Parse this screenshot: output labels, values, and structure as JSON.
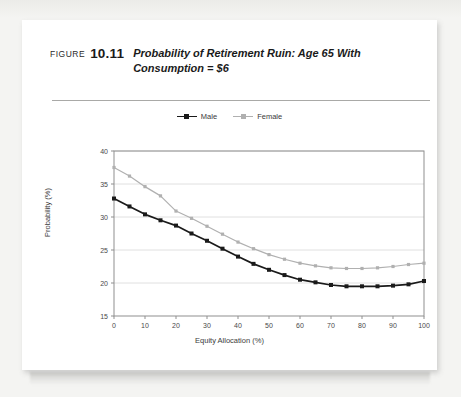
{
  "figure": {
    "label": "FIGURE",
    "number": "10.11",
    "title": "Probability of Retirement Ruin: Age 65 With Consumption = $6"
  },
  "legend": {
    "position": "top-center",
    "items": [
      {
        "name": "Male",
        "color": "#1a1a1a"
      },
      {
        "name": "Female",
        "color": "#b0b0b0"
      }
    ]
  },
  "chart_data": {
    "type": "line",
    "title": "Probability of Retirement Ruin: Age 65 With Consumption = $6",
    "xlabel": "Equity Allocation (%)",
    "ylabel": "Probability (%)",
    "xlim": [
      0,
      100
    ],
    "ylim": [
      15,
      40
    ],
    "xticks": [
      0,
      10,
      20,
      30,
      40,
      50,
      60,
      70,
      80,
      90,
      100
    ],
    "yticks": [
      15,
      20,
      25,
      30,
      35,
      40
    ],
    "grid": "horizontal",
    "x": [
      0,
      5,
      10,
      15,
      20,
      25,
      30,
      35,
      40,
      45,
      50,
      55,
      60,
      65,
      70,
      75,
      80,
      85,
      90,
      95,
      100
    ],
    "series": [
      {
        "name": "Male",
        "color": "#1a1a1a",
        "marker": "square",
        "values": [
          32.8,
          31.6,
          30.4,
          29.5,
          28.7,
          27.5,
          26.4,
          25.2,
          24.0,
          22.9,
          22.0,
          21.2,
          20.5,
          20.1,
          19.7,
          19.5,
          19.5,
          19.5,
          19.6,
          19.8,
          20.3
        ]
      },
      {
        "name": "Female",
        "color": "#b0b0b0",
        "marker": "square",
        "values": [
          37.5,
          36.2,
          34.6,
          33.2,
          30.9,
          29.8,
          28.6,
          27.4,
          26.2,
          25.2,
          24.3,
          23.6,
          23.0,
          22.6,
          22.3,
          22.2,
          22.2,
          22.3,
          22.5,
          22.8,
          23.0
        ]
      }
    ]
  },
  "axes": {
    "x_tick_labels": [
      "0",
      "10",
      "20",
      "30",
      "40",
      "50",
      "60",
      "70",
      "80",
      "90",
      "100"
    ],
    "y_tick_labels": [
      "15",
      "20",
      "25",
      "30",
      "35",
      "40"
    ],
    "x_title": "Equity Allocation (%)",
    "y_title": "Probability (%)"
  }
}
